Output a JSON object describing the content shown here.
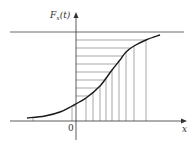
{
  "figure": {
    "y_axis_label": "F",
    "y_axis_label_subscript": "x",
    "y_axis_label_arg": "(t)",
    "x_axis_label": "x",
    "origin_label": "0"
  },
  "chart_data": {
    "type": "line",
    "title": "",
    "xlabel": "x",
    "ylabel": "F_x(t)",
    "asymptote": "upper horizontal line (F = 1)",
    "grid": false,
    "curve_points_px": [
      [
        27,
        118
      ],
      [
        45,
        116
      ],
      [
        60,
        112
      ],
      [
        72,
        106
      ],
      [
        86,
        98
      ],
      [
        100,
        86
      ],
      [
        112,
        70
      ],
      [
        120,
        60
      ],
      [
        126,
        52
      ],
      [
        134,
        46
      ],
      [
        146,
        40
      ],
      [
        160,
        35
      ]
    ],
    "horizontal_hatch_y_px": [
      40,
      48,
      56,
      64,
      72,
      80,
      88,
      96,
      104
    ],
    "vertical_hatch_x_px": [
      33,
      72,
      86,
      93,
      100,
      106,
      112,
      119,
      126,
      134,
      146
    ]
  },
  "colors": {
    "ink": "#333333",
    "curve": "#1a1a1a",
    "hatch": "#6b6b6b",
    "background": "#ffffff"
  }
}
